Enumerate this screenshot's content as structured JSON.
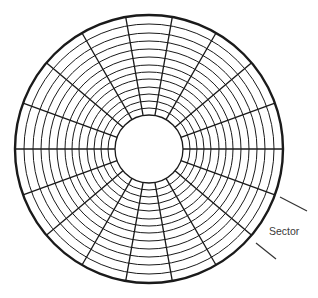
{
  "diagram": {
    "type": "disk-platter-tracks-sectors",
    "center": [
      149,
      149
    ],
    "outer_radius": 134,
    "inner_hole_radius": 34,
    "track_radii": [
      34,
      41,
      48,
      55,
      62,
      70,
      77,
      84,
      92,
      100,
      108,
      116,
      125,
      134
    ],
    "radial_line_count": 18,
    "radial_angle_step_deg": 20,
    "stroke_color": "#1a1a1a",
    "background_color": "#ffffff"
  },
  "annotations": {
    "sector_label": "Sector",
    "pointer_lines": [
      {
        "x1": 280,
        "y1": 197,
        "x2": 307,
        "y2": 211
      },
      {
        "x1": 256,
        "y1": 243,
        "x2": 276,
        "y2": 259
      }
    ]
  }
}
